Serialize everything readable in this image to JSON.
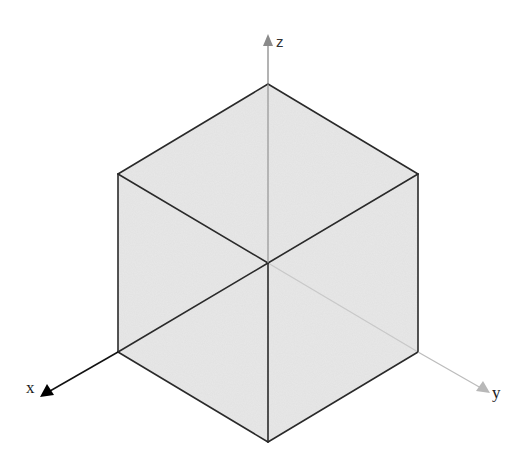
{
  "diagram": {
    "cube": {
      "fill_color": "#e6e6e6",
      "edge_color": "#2a2a2a",
      "hidden_edge_color": "#c4c4c4",
      "vertices": {
        "top": [
          268,
          84
        ],
        "upper_left": [
          118,
          174
        ],
        "upper_right": [
          418,
          174
        ],
        "center": [
          268,
          263
        ],
        "lower_left": [
          118,
          352
        ],
        "lower_right": [
          418,
          352
        ],
        "bottom": [
          268,
          442
        ]
      }
    },
    "axes": [
      {
        "name": "x",
        "label": "x",
        "color": "#111111",
        "from": [
          118,
          352
        ],
        "to": [
          44,
          395
        ],
        "label_pos": [
          26,
          392
        ]
      },
      {
        "name": "y",
        "label": "y",
        "color": "#b5b5b5",
        "from": [
          418,
          352
        ],
        "to": [
          487,
          391
        ],
        "label_pos": [
          492,
          397
        ]
      },
      {
        "name": "z",
        "label": "z",
        "color": "#8a8a8a",
        "from": [
          268,
          84
        ],
        "to": [
          268,
          36
        ],
        "label_pos": [
          277,
          47
        ]
      }
    ]
  }
}
